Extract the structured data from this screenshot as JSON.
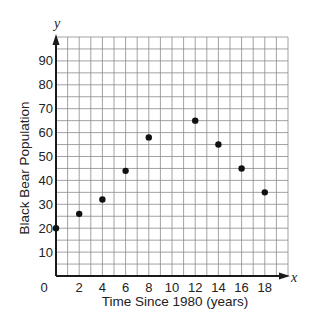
{
  "chart_data": {
    "type": "scatter",
    "title": "",
    "xlabel": "Time Since 1980 (years)",
    "ylabel": "Black Bear Population",
    "x_var": "x",
    "y_var": "y",
    "xlim": [
      0,
      20
    ],
    "ylim": [
      0,
      100
    ],
    "grid": true,
    "grid_step_x": 1,
    "grid_step_y": 5,
    "x_ticks": [
      0,
      2,
      4,
      6,
      8,
      10,
      12,
      14,
      16,
      18
    ],
    "x_tick_labels": [
      "0",
      "2",
      "4",
      "6",
      "8",
      "10",
      "12",
      "14",
      "16",
      "18"
    ],
    "y_ticks": [
      10,
      20,
      30,
      40,
      50,
      60,
      70,
      80,
      90
    ],
    "y_tick_labels": [
      "10",
      "20",
      "30",
      "40",
      "50",
      "60",
      "70",
      "80",
      "90"
    ],
    "legend": null,
    "series": [
      {
        "name": "Black Bear Population",
        "x": [
          0,
          2,
          4,
          6,
          8,
          12,
          14,
          16,
          18
        ],
        "y": [
          20,
          26,
          32,
          44,
          58,
          65,
          55,
          45,
          35
        ]
      }
    ],
    "colors": {
      "point": "#111111",
      "grid": "#8a8a8a",
      "axis": "#1a1a1a"
    }
  }
}
